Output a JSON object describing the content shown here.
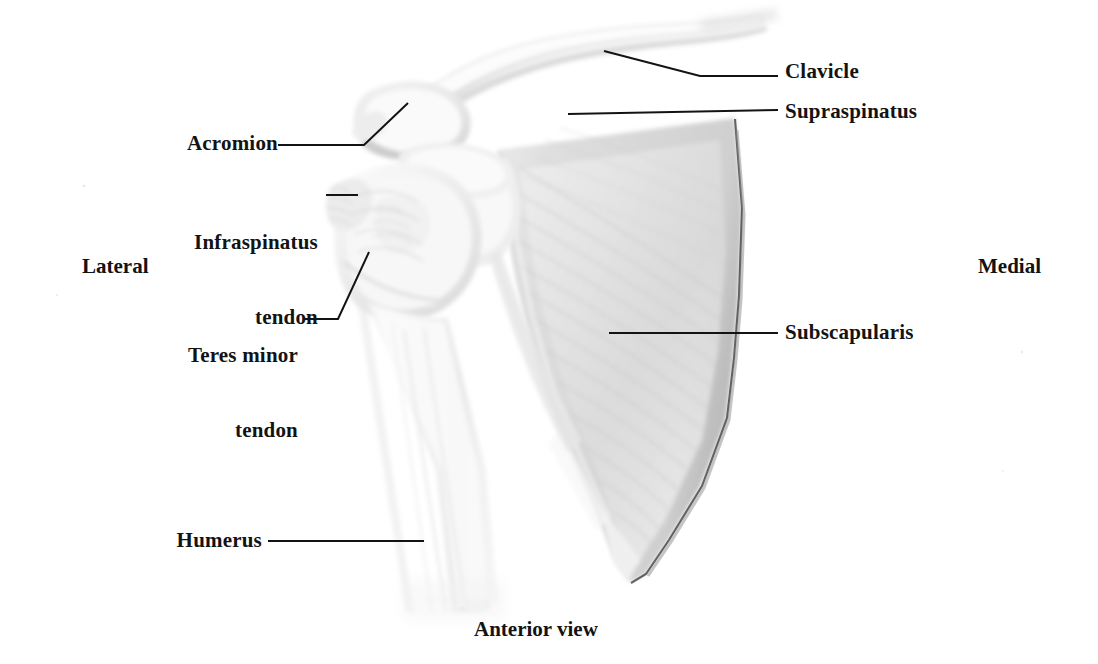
{
  "figure": {
    "title": "Anterior view",
    "orientation": {
      "left": "Lateral",
      "right": "Medial"
    },
    "background_color": "#ffffff",
    "ink_color": "#131313",
    "bone_tone_light": "#f7f7f7",
    "bone_tone_mid": "#e3e3e3",
    "bone_tone_shadow": "#c9c9c9",
    "labels": [
      {
        "id": "clavicle",
        "text": "Clavicle",
        "align": "left"
      },
      {
        "id": "supraspinatus",
        "text": "Supraspinatus",
        "align": "left"
      },
      {
        "id": "acromion",
        "text": "Acromion",
        "align": "right"
      },
      {
        "id": "infraspinatus-tendon",
        "line1": "Infraspinatus",
        "line2": "tendon",
        "align": "right"
      },
      {
        "id": "teres-minor-tendon",
        "line1": "Teres minor",
        "line2": "tendon",
        "align": "right"
      },
      {
        "id": "subscapularis",
        "text": "Subscapularis",
        "align": "left"
      },
      {
        "id": "humerus",
        "text": "Humerus",
        "align": "right"
      }
    ],
    "structures": [
      "clavicle",
      "acromion",
      "coracoid process",
      "humeral head",
      "greater tuberosity",
      "humerus shaft",
      "scapula body",
      "glenoid",
      "inferior angle"
    ]
  }
}
